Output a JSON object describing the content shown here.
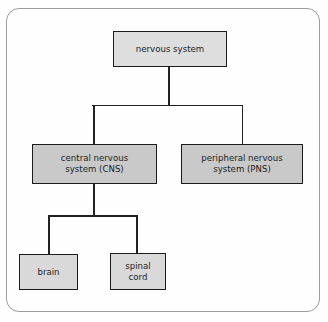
{
  "diagram": {
    "colors": {
      "frame_border": "#9b9b9b",
      "node_border": "#1b1b1b",
      "level0_fill": "#dedede",
      "level1_fill": "#c9c9c9",
      "level2_fill": "#d9d9d9",
      "connector": "#222222",
      "text": "#1d1d1d",
      "background": "#fefefe"
    },
    "nodes": {
      "root": {
        "label": "nervous system"
      },
      "cns": {
        "label": "central nervous\nsystem (CNS)"
      },
      "pns": {
        "label": "peripheral nervous\nsystem (PNS)"
      },
      "brain": {
        "label": "brain"
      },
      "spinal_cord": {
        "label": "spinal\ncord"
      }
    },
    "edges": [
      {
        "from": "root",
        "to": "cns"
      },
      {
        "from": "root",
        "to": "pns"
      },
      {
        "from": "cns",
        "to": "brain"
      },
      {
        "from": "cns",
        "to": "spinal_cord"
      }
    ]
  }
}
